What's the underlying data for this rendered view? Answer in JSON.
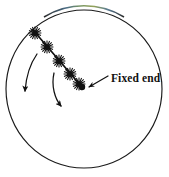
{
  "figure": {
    "type": "physics-diagram",
    "background_color": "#ffffff",
    "stroke_color": "#1a1a1a",
    "boundary": {
      "shape": "circle",
      "name": "circular-boundary",
      "center_x": 84,
      "center_y": 89,
      "radius_x": 78,
      "radius_y": 79,
      "stroke_width": 1.1,
      "top_arc_tint": "#6f8f5a"
    },
    "rod": {
      "name": "flexible-rod",
      "start_x": 33,
      "start_y": 30,
      "end_x": 82,
      "end_y": 87,
      "stroke_width": 1.6,
      "burst_count": 5,
      "burst_positions": [
        {
          "x": 35,
          "y": 33
        },
        {
          "x": 47,
          "y": 47
        },
        {
          "x": 59,
          "y": 61
        },
        {
          "x": 70,
          "y": 74
        },
        {
          "x": 79,
          "y": 84
        }
      ],
      "burst_radius": 6.5
    },
    "fixed_end_dot": {
      "name": "fixed-end-dot",
      "x": 82,
      "y": 87,
      "radius": 3.1,
      "fill": "#111111"
    },
    "callout": {
      "name": "fixed-end-callout",
      "label": "Fixed end",
      "text_x": 111,
      "text_y": 82,
      "font_size": 11.5,
      "arrow_tail_x": 108,
      "arrow_tail_y": 76,
      "arrow_head_x": 87,
      "arrow_head_y": 88
    },
    "motion_arrows": [
      {
        "name": "motion-arrow-outer",
        "path": "M 37,54 C 30,64 26,78 25,91",
        "head_x": 25,
        "head_y": 97,
        "head_angle": 97
      },
      {
        "name": "motion-arrow-inner",
        "path": "M 54,73 C 51,86 55,99 61,106",
        "head_x": 65,
        "head_y": 111,
        "head_angle": 48
      }
    ]
  }
}
